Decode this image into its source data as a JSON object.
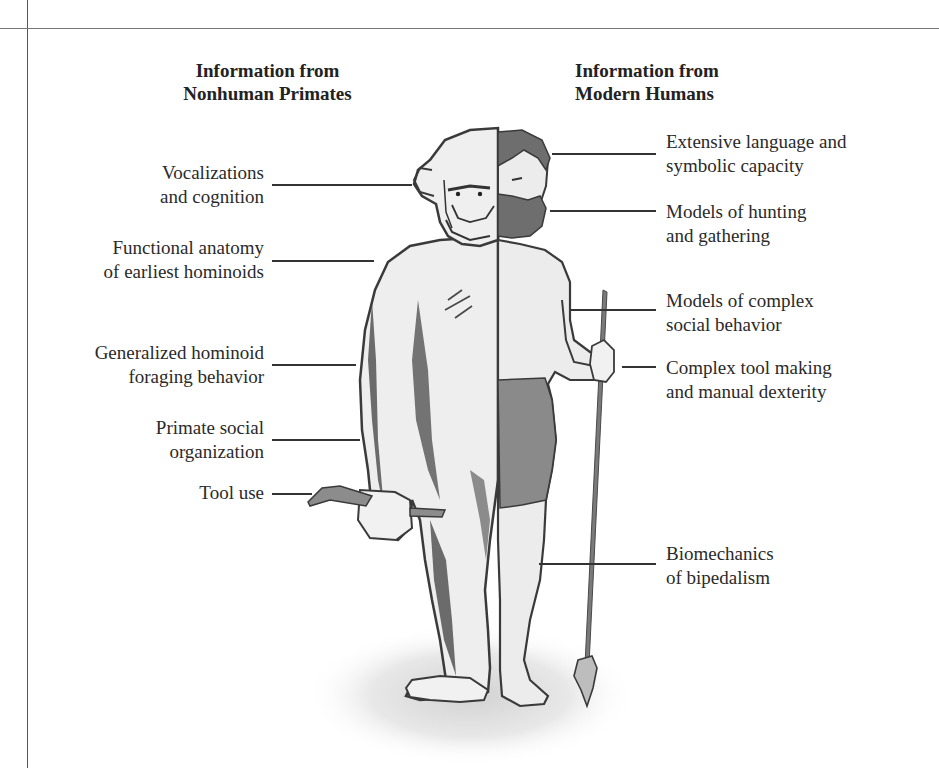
{
  "headings": {
    "left": [
      "Information from",
      "Nonhuman Primates"
    ],
    "right": [
      "Information from",
      "Modern Humans"
    ]
  },
  "left_labels": [
    {
      "lines": [
        "Vocalizations",
        "and cognition"
      ]
    },
    {
      "lines": [
        "Functional anatomy",
        "of earliest hominoids"
      ]
    },
    {
      "lines": [
        "Generalized hominoid",
        "foraging behavior"
      ]
    },
    {
      "lines": [
        "Primate social",
        "organization"
      ]
    },
    {
      "lines": [
        "Tool use"
      ]
    }
  ],
  "right_labels": [
    {
      "lines": [
        "Extensive language and",
        "symbolic capacity"
      ]
    },
    {
      "lines": [
        "Models of hunting",
        "and gathering"
      ]
    },
    {
      "lines": [
        "Models of complex",
        "social behavior"
      ]
    },
    {
      "lines": [
        "Complex tool making",
        "and manual dexterity"
      ]
    },
    {
      "lines": [
        "Biomechanics",
        "of bipedalism"
      ]
    }
  ],
  "figure": {
    "left_half": "chimpanzee",
    "right_half": "modern-human",
    "colors": {
      "outline": "#3a3a3a",
      "fur_shading": "#4a4a4a",
      "skin": "#ececec",
      "hair_beard": "#6e6e6e",
      "loincloth": "#8a8a8a",
      "spear": "#7a7a7a",
      "tool": "#8c8c8c"
    }
  }
}
